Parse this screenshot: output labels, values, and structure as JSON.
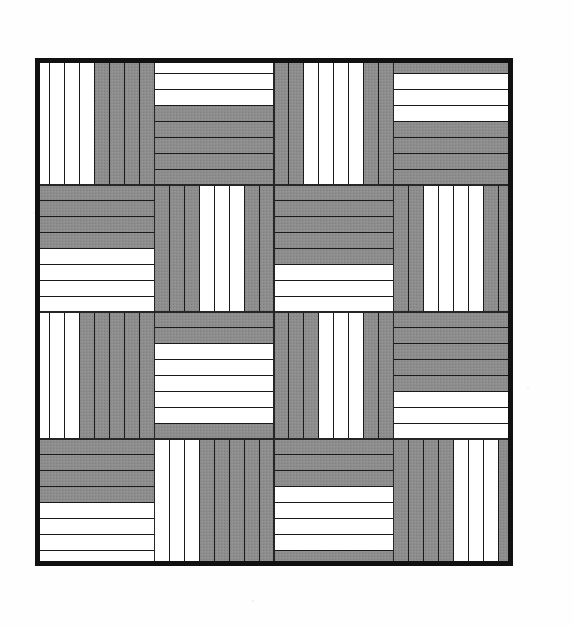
{
  "document": {
    "title": "Rail Fence / Streak of Lightning quilt block diagram",
    "medium": "printed black-and-white quilt pattern diagram",
    "page_background": "#fefefe"
  },
  "figure": {
    "name": "quilt-pattern",
    "pattern_name": "Rail Fence (Streak of Lightning) quilt layout",
    "frame": {
      "x": 35,
      "y": 58,
      "width": 478,
      "height": 508,
      "border_color": "#111111",
      "border_width_px": 5
    },
    "colors": {
      "light_strip": "#ffffff",
      "dark_strip": "#8d8d8d",
      "dark_strip_shade": "#7f7f7f",
      "strip_outline": "#1a1a1a",
      "block_seam": "#262626",
      "outer_border": "#111111",
      "page": "#fefefe"
    },
    "grid": {
      "blocks_across": 4,
      "blocks_down": 4,
      "strips_per_block": 8,
      "block_width_px": 119.5,
      "block_height_px": 127,
      "strip_outline_width_px": 1.1,
      "block_seam_width_px": 1.8
    },
    "legend": {
      "dark_meaning": "dark fabric strip",
      "light_meaning": "light fabric strip"
    },
    "block_layout": {
      "description": "Each block holds 8 equal strips. Orientation alternates like a checkerboard so strips run vertical in one block and horizontal in its neighbours, producing the zig-zag 'streak of lightning' diagonals.",
      "orientation_rule": "vertical when (row + col) is even, horizontal when odd",
      "light_run_rule": "number of light strips per block steps 4,3,2,1,0 across the diagonal so the white strips form a staircase",
      "orientations": [
        [
          "V",
          "H",
          "V",
          "H"
        ],
        [
          "H",
          "V",
          "H",
          "V"
        ],
        [
          "V",
          "H",
          "V",
          "H"
        ],
        [
          "H",
          "V",
          "H",
          "V"
        ]
      ],
      "light_counts": [
        [
          4,
          2,
          4,
          2
        ],
        [
          2,
          4,
          2,
          4
        ],
        [
          4,
          2,
          4,
          2
        ],
        [
          2,
          4,
          2,
          4
        ]
      ],
      "light_from_start": [
        [
          true,
          false,
          true,
          false
        ],
        [
          false,
          true,
          false,
          true
        ],
        [
          true,
          false,
          true,
          false
        ],
        [
          false,
          true,
          false,
          true
        ]
      ]
    },
    "strip_map": {
      "note": "0 = dark strip, 1 = light strip. Rows of the array are quilt block rows; each block lists its 8 strips in order (left to right for vertical blocks, top to bottom for horizontal blocks).",
      "rows": [
        [
          [
            1,
            1,
            1,
            1,
            0,
            0,
            0,
            0
          ],
          [
            1,
            1,
            1,
            0,
            0,
            0,
            0,
            0
          ],
          [
            0,
            0,
            1,
            1,
            1,
            1,
            0,
            0
          ],
          [
            0,
            1,
            1,
            1,
            0,
            0,
            0,
            0
          ]
        ],
        [
          [
            0,
            0,
            0,
            0,
            1,
            1,
            1,
            1
          ],
          [
            0,
            0,
            0,
            1,
            1,
            1,
            0,
            0
          ],
          [
            0,
            0,
            0,
            0,
            0,
            1,
            1,
            1
          ],
          [
            0,
            0,
            1,
            1,
            1,
            1,
            0,
            0
          ]
        ],
        [
          [
            1,
            1,
            1,
            0,
            0,
            0,
            0,
            0
          ],
          [
            0,
            0,
            1,
            1,
            1,
            1,
            1,
            0
          ],
          [
            0,
            0,
            0,
            1,
            1,
            1,
            0,
            0
          ],
          [
            0,
            0,
            0,
            0,
            0,
            1,
            1,
            1
          ]
        ],
        [
          [
            0,
            0,
            0,
            0,
            1,
            1,
            1,
            1
          ],
          [
            1,
            1,
            1,
            0,
            0,
            0,
            0,
            0
          ],
          [
            0,
            0,
            0,
            1,
            1,
            1,
            1,
            0
          ],
          [
            0,
            0,
            0,
            0,
            1,
            1,
            1,
            0
          ]
        ]
      ]
    }
  }
}
